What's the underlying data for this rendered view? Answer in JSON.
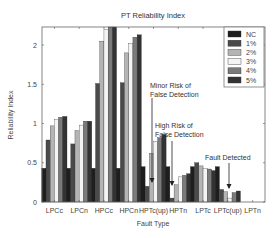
{
  "chart_data": {
    "type": "bar",
    "title": "PT Reliability Index",
    "xlabel": "Fault Type",
    "ylabel": "Reliability Index",
    "ylim": [
      0,
      2.23
    ],
    "yticks": [
      0,
      0.5,
      1,
      1.5,
      2
    ],
    "ytick_labels": [
      "0",
      "0.5",
      "1",
      "1.5",
      "2"
    ],
    "grid": false,
    "legend_position": "upper right",
    "categories": [
      "LPCc",
      "LPCn",
      "HPCc",
      "HPCn",
      "HPTc(up)",
      "HPTn",
      "LPTc",
      "LPTc(up)",
      "LPTn"
    ],
    "series": [
      {
        "name": "NC",
        "color": "#1e1e1e",
        "values": [
          0.43,
          0.43,
          0.43,
          0.43,
          0.45,
          0.45,
          0.45,
          0.45,
          0.0
        ]
      },
      {
        "name": "1%",
        "color": "#4a4a4a",
        "values": [
          0.79,
          0.74,
          1.51,
          1.52,
          0.2,
          0.05,
          0.5,
          0.16,
          0.0
        ]
      },
      {
        "name": "2%",
        "color": "#b4b4b4",
        "values": [
          0.97,
          0.91,
          2.05,
          1.9,
          0.62,
          0.22,
          0.46,
          0.13,
          0.0
        ]
      },
      {
        "name": "3%",
        "color": "#f4f4f4",
        "values": [
          1.05,
          0.98,
          2.2,
          2.02,
          0.77,
          0.32,
          0.43,
          0.05,
          0.0
        ]
      },
      {
        "name": "4%",
        "color": "#7a7a7a",
        "values": [
          1.08,
          1.03,
          2.25,
          2.1,
          0.82,
          0.34,
          0.42,
          0.12,
          0.0
        ]
      },
      {
        "name": "5%",
        "color": "#333333",
        "values": [
          1.09,
          1.03,
          2.25,
          2.13,
          0.86,
          0.36,
          0.4,
          0.14,
          0.0
        ]
      }
    ],
    "annotations": [
      {
        "text": [
          "Minor Risk of",
          "False Detection"
        ],
        "category": "HPTc(up)"
      },
      {
        "text": [
          "High Risk of",
          "False Detection"
        ],
        "category": "HPTn"
      },
      {
        "text": [
          "Fault Detected"
        ],
        "category": "LPTc(up)"
      }
    ]
  }
}
